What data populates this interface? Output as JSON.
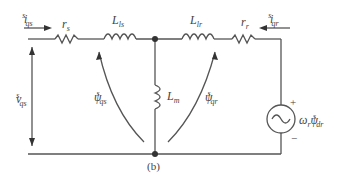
{
  "diagram": {
    "caption": "(b)",
    "labels": {
      "i_qs": {
        "base": "i",
        "sup": "s",
        "sub": "qs"
      },
      "r_s": {
        "base": "r",
        "sub": "s"
      },
      "L_ls": {
        "base": "L",
        "sub": "ls"
      },
      "L_lr": {
        "base": "L",
        "sub": "lr"
      },
      "r_r": {
        "base": "r",
        "sub": "r"
      },
      "i_qr": {
        "base": "i",
        "sup": "s",
        "sub": "qr"
      },
      "L_m": {
        "base": "L",
        "sub": "m"
      },
      "v_qs": {
        "base": "v",
        "sup": "s",
        "sub": "qs"
      },
      "psi_qs": {
        "base": "ψ",
        "sup": "s",
        "sub": "qs"
      },
      "psi_qr": {
        "base": "ψ",
        "sup": "s",
        "sub": "qr"
      },
      "source": {
        "base": "ω",
        "sub1": "r",
        "base2": "ψ",
        "sup": "s",
        "sub": "dr"
      },
      "plus": "+",
      "minus": "−"
    },
    "colors": {
      "wire": "#555555",
      "text": "#444444"
    }
  }
}
